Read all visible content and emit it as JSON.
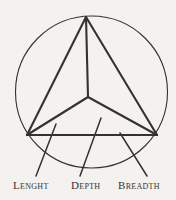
{
  "figure": {
    "background_color": "#f4f2ef",
    "ink_color": "#35312e",
    "circle": {
      "name": "enclosing-circle",
      "cx": 91.5,
      "cy": 92,
      "r": 76,
      "stroke_width": 1.1
    },
    "vertices": {
      "apex": {
        "x": 86,
        "y": 17
      },
      "left": {
        "x": 27,
        "y": 135
      },
      "right": {
        "x": 157,
        "y": 135
      },
      "center": {
        "x": 88,
        "y": 97
      }
    },
    "edges": [
      {
        "name": "edge-apex-to-left",
        "x1": 86,
        "y1": 17,
        "x2": 27,
        "y2": 135
      },
      {
        "name": "edge-apex-to-right",
        "x1": 86,
        "y1": 17,
        "x2": 157,
        "y2": 135
      },
      {
        "name": "edge-apex-to-center",
        "x1": 86,
        "y1": 17,
        "x2": 88,
        "y2": 97
      },
      {
        "name": "edge-left-to-right-base",
        "x1": 27,
        "y1": 135,
        "x2": 157,
        "y2": 135
      },
      {
        "name": "edge-center-to-left",
        "x1": 88,
        "y1": 97,
        "x2": 27,
        "y2": 135
      },
      {
        "name": "edge-center-to-right",
        "x1": 88,
        "y1": 97,
        "x2": 157,
        "y2": 135
      }
    ],
    "leader_lines": [
      {
        "name": "leader-line-lenght",
        "x1": 56,
        "y1": 124,
        "x2": 36,
        "y2": 176
      },
      {
        "name": "leader-line-depth",
        "x1": 101,
        "y1": 118,
        "x2": 80,
        "y2": 176
      },
      {
        "name": "leader-line-breadth",
        "x1": 120,
        "y1": 133,
        "x2": 147,
        "y2": 176
      }
    ],
    "labels": {
      "lenght": "Lenght",
      "depth": "Depth",
      "breadth": "Breadth"
    }
  }
}
